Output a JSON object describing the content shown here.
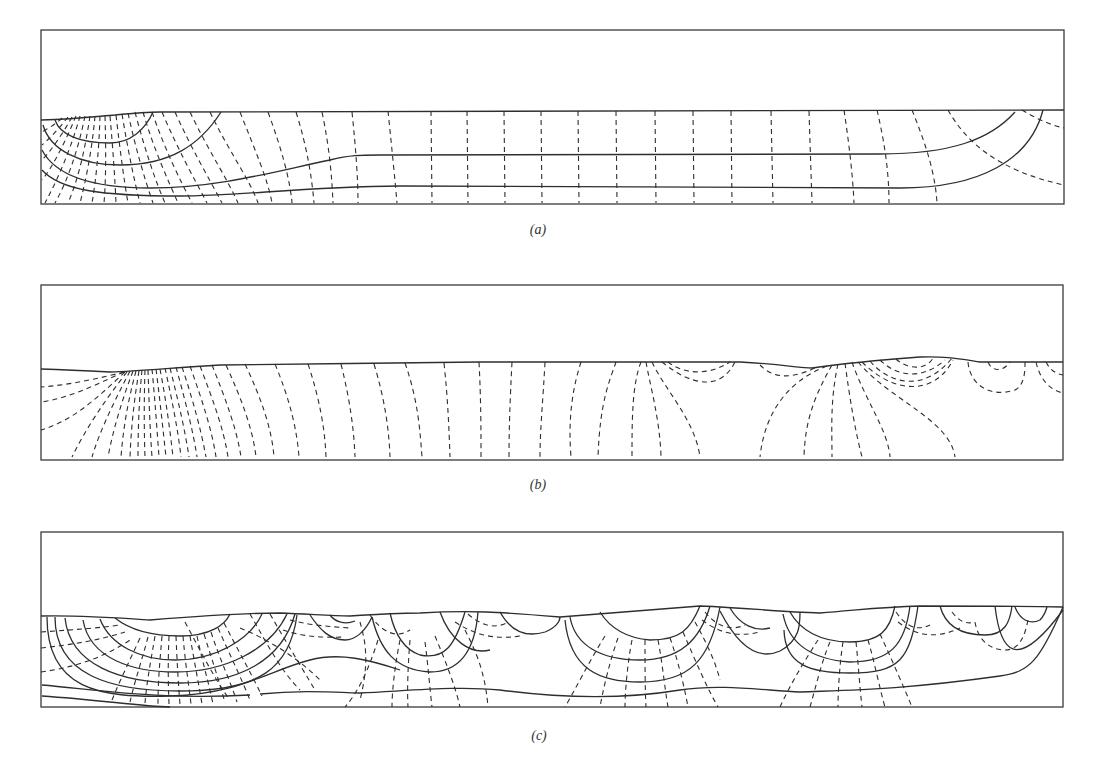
{
  "figure": {
    "panels": [
      {
        "id": "a",
        "label": "(a)"
      },
      {
        "id": "b",
        "label": "(b)"
      },
      {
        "id": "c",
        "label": "(c)"
      }
    ],
    "line_styles": {
      "solid": "#2e2e2e",
      "dashed": "#2e2e2e",
      "frame": "#3a3a3a"
    },
    "background": "#ffffff"
  }
}
